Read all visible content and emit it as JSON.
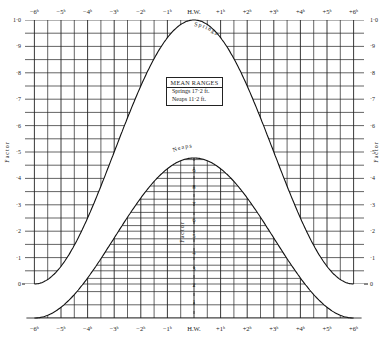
{
  "chart_data": {
    "type": "line",
    "title": "",
    "xlabel": "Hours from High Water",
    "ylabel": "Factor",
    "x_ticks": [
      "-6h",
      "-5h",
      "-4h",
      "-3h",
      "-2h",
      "-1h",
      "H.W.",
      "+1h",
      "+2h",
      "+3h",
      "+4h",
      "+5h",
      "+6h"
    ],
    "y_ticks": [
      "0",
      "1",
      "2",
      "3",
      "4",
      "5",
      "6",
      "7",
      "8",
      "9",
      "1.0"
    ],
    "y_tick_labels_display": [
      "0",
      "·1",
      "·2",
      "·3",
      "·4",
      "·5",
      "·6",
      "·7",
      "·8",
      "·9",
      "1·0"
    ],
    "ylim": [
      0,
      1.0
    ],
    "grid": true,
    "series": [
      {
        "name": "Springs",
        "x": [
          -6,
          -5,
          -4,
          -3,
          -2,
          -1,
          0,
          1,
          2,
          3,
          4,
          5,
          6
        ],
        "values": [
          0.0,
          0.04,
          0.18,
          0.4,
          0.66,
          0.9,
          1.0,
          0.9,
          0.66,
          0.4,
          0.18,
          0.04,
          0.0
        ]
      },
      {
        "name": "Neaps",
        "x": [
          -6,
          -5,
          -4,
          -3,
          -2,
          -1,
          0,
          1,
          2,
          3,
          4,
          5,
          6
        ],
        "values": [
          0.0,
          0.1,
          0.3,
          0.53,
          0.75,
          0.92,
          1.0,
          0.92,
          0.75,
          0.53,
          0.3,
          0.1,
          0.0
        ]
      }
    ],
    "annotations": {
      "mean_ranges_title": "MEAN RANGES",
      "springs_range": "Springs  17·2 ft.",
      "neaps_range": "Neaps   11·2 ft."
    }
  },
  "labels": {
    "hw": "H.W.",
    "factor": "Factor",
    "springs_curve": "Springs",
    "neaps_curve": "Neaps"
  }
}
